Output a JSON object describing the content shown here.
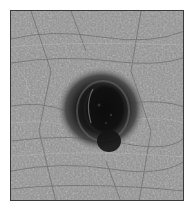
{
  "image": {
    "subject": "close-up grayscale photograph of a dark pigmented skin lesion on textured skin",
    "colors": {
      "frame_border": "#3a3a3a",
      "skin_base": "#8e8e8e",
      "skin_highlight": "#bdbdbd",
      "skin_crease": "#5e5e5e",
      "lesion_halo": "#3c3c3c",
      "lesion_core": "#0c0c0c",
      "lesion_ring": "#6a6a6a"
    }
  }
}
